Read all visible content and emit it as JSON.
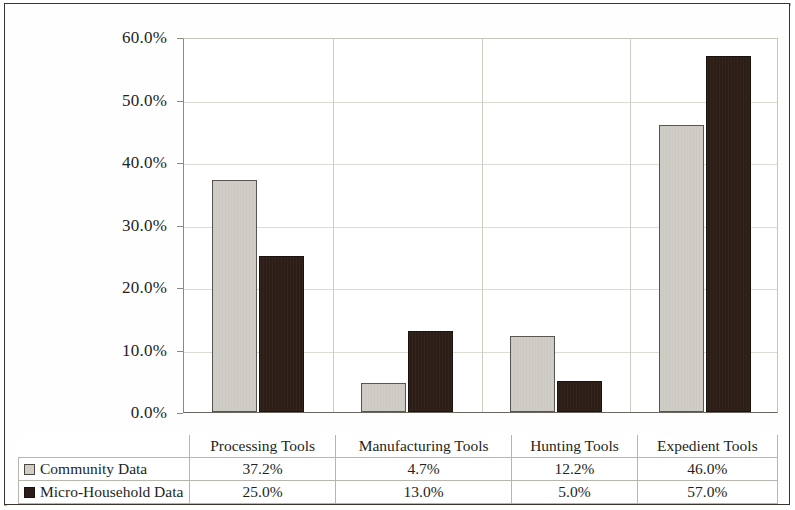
{
  "chart_data": {
    "type": "bar",
    "title": "",
    "subtitle": "",
    "xlabel": "",
    "ylabel": "",
    "categories": [
      "Processing Tools",
      "Manufacturing Tools",
      "Hunting Tools",
      "Expedient Tools"
    ],
    "series": [
      {
        "name": "Community Data",
        "swatch": "series-a",
        "color": "#cfcdc6",
        "values": [
          37.2,
          4.7,
          12.2,
          46.0
        ],
        "value_labels": [
          "37.2%",
          "4.7%",
          "12.2%",
          "46.0%"
        ]
      },
      {
        "name": "Micro-Household Data",
        "swatch": "series-b",
        "color": "#2c1d16",
        "values": [
          25.0,
          13.0,
          5.0,
          57.0
        ],
        "value_labels": [
          "25.0%",
          "13.0%",
          "5.0%",
          "57.0%"
        ]
      }
    ],
    "ylim": [
      0,
      60
    ],
    "ytick_values": [
      0,
      10,
      20,
      30,
      40,
      50,
      60
    ],
    "ytick_labels": [
      "0.0%",
      "10.0%",
      "20.0%",
      "30.0%",
      "40.0%",
      "50.0%",
      "60.0%"
    ],
    "grid": true,
    "legend_position": "bottom-table",
    "unit": "%"
  },
  "table": {
    "corner_label": "",
    "column_headers": [
      "Processing Tools",
      "Manufacturing Tools",
      "Hunting Tools",
      "Expedient Tools"
    ],
    "rows": [
      {
        "label": "Community Data",
        "swatch": "series-a",
        "values": [
          "37.2%",
          "4.7%",
          "12.2%",
          "46.0%"
        ]
      },
      {
        "label": "Micro-Household Data",
        "swatch": "series-b",
        "values": [
          "25.0%",
          "13.0%",
          "5.0%",
          "57.0%"
        ]
      }
    ]
  },
  "axis": {
    "y_labels": [
      "60.0%",
      "50.0%",
      "40.0%",
      "30.0%",
      "20.0%",
      "10.0%",
      "0.0%"
    ]
  },
  "colors": {
    "series_a": "#cfcdc6",
    "series_b": "#2c1d16",
    "gridline": "#dedbd5",
    "axis": "#6a655f",
    "frame": "#3a332e",
    "text": "#241f1c"
  }
}
